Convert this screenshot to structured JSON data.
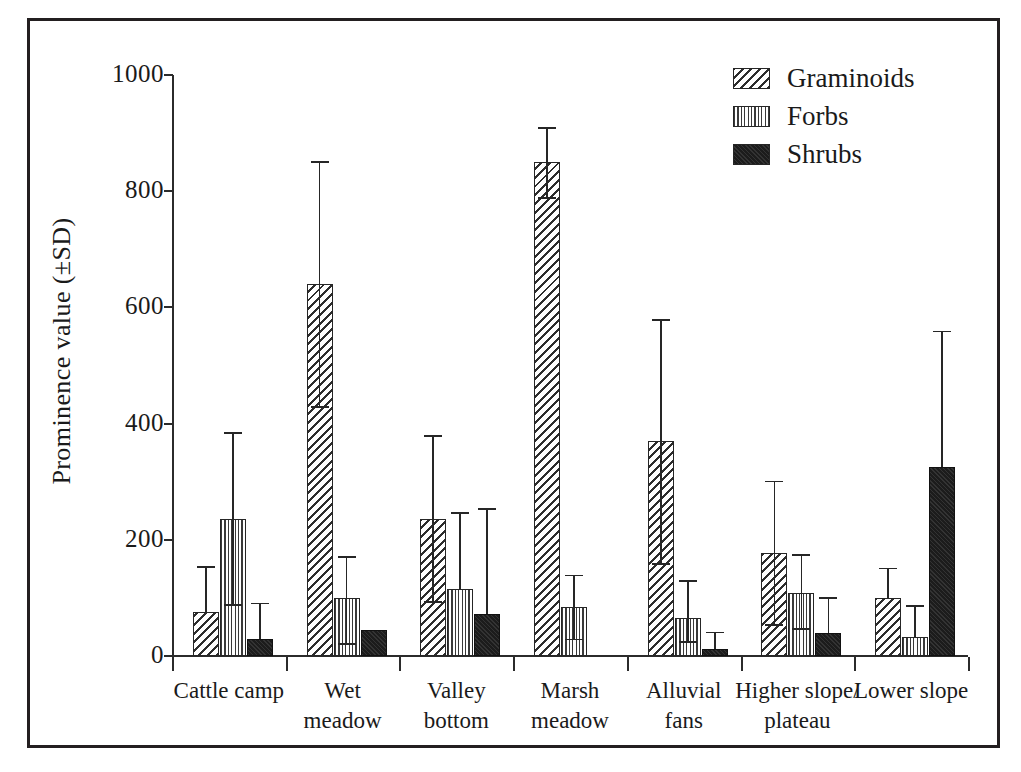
{
  "chart_data": {
    "type": "bar",
    "title": "",
    "xlabel": "",
    "ylabel": "Prominence value (±SD)",
    "ylim": [
      0,
      1000
    ],
    "yticks": [
      0,
      200,
      400,
      600,
      800,
      1000
    ],
    "ytick_labels": [
      "0",
      "200",
      "400",
      "600",
      "800",
      "1000"
    ],
    "grid": false,
    "legend_position": "top-right",
    "error_bars": "±SD",
    "categories": [
      "Cattle camp",
      "Wet meadow",
      "Valley bottom",
      "Marsh meadow",
      "Alluvial fans",
      "Higher slope/ plateau",
      "Lower slope"
    ],
    "category_lines": [
      [
        "Cattle camp",
        ""
      ],
      [
        "Wet",
        "meadow"
      ],
      [
        "Valley",
        "bottom"
      ],
      [
        "Marsh",
        "meadow"
      ],
      [
        "Alluvial",
        "fans"
      ],
      [
        "Higher slope/",
        "plateau"
      ],
      [
        "Lower slope",
        ""
      ]
    ],
    "series": [
      {
        "name": "Graminoids",
        "pattern": "diagonal-hatch",
        "color": "#2d2d2d",
        "values": [
          75,
          640,
          235,
          850,
          370,
          178,
          100
        ],
        "err_high": [
          155,
          852,
          380,
          910,
          580,
          302,
          152
        ],
        "err_low": [
          null,
          430,
          95,
          790,
          160,
          55,
          null
        ]
      },
      {
        "name": "Forbs",
        "pattern": "stipple-dots",
        "color": "#3a3a3a",
        "values": [
          235,
          100,
          115,
          85,
          65,
          108,
          33
        ],
        "err_high": [
          385,
          172,
          248,
          140,
          130,
          175,
          88
        ],
        "err_low": [
          90,
          22,
          null,
          30,
          25,
          48,
          null
        ]
      },
      {
        "name": "Shrubs",
        "pattern": "solid-black",
        "color": "#1c1c1c",
        "values": [
          30,
          45,
          73,
          null,
          12,
          40,
          325
        ],
        "err_high": [
          92,
          null,
          255,
          null,
          42,
          102,
          560
        ],
        "err_low": [
          null,
          null,
          null,
          null,
          null,
          null,
          null
        ]
      }
    ]
  },
  "legend": {
    "items": [
      {
        "label": "Graminoids",
        "pattern": "diagonal-hatch"
      },
      {
        "label": "Forbs",
        "pattern": "stipple-dots"
      },
      {
        "label": "Shrubs",
        "pattern": "solid-black"
      }
    ]
  }
}
